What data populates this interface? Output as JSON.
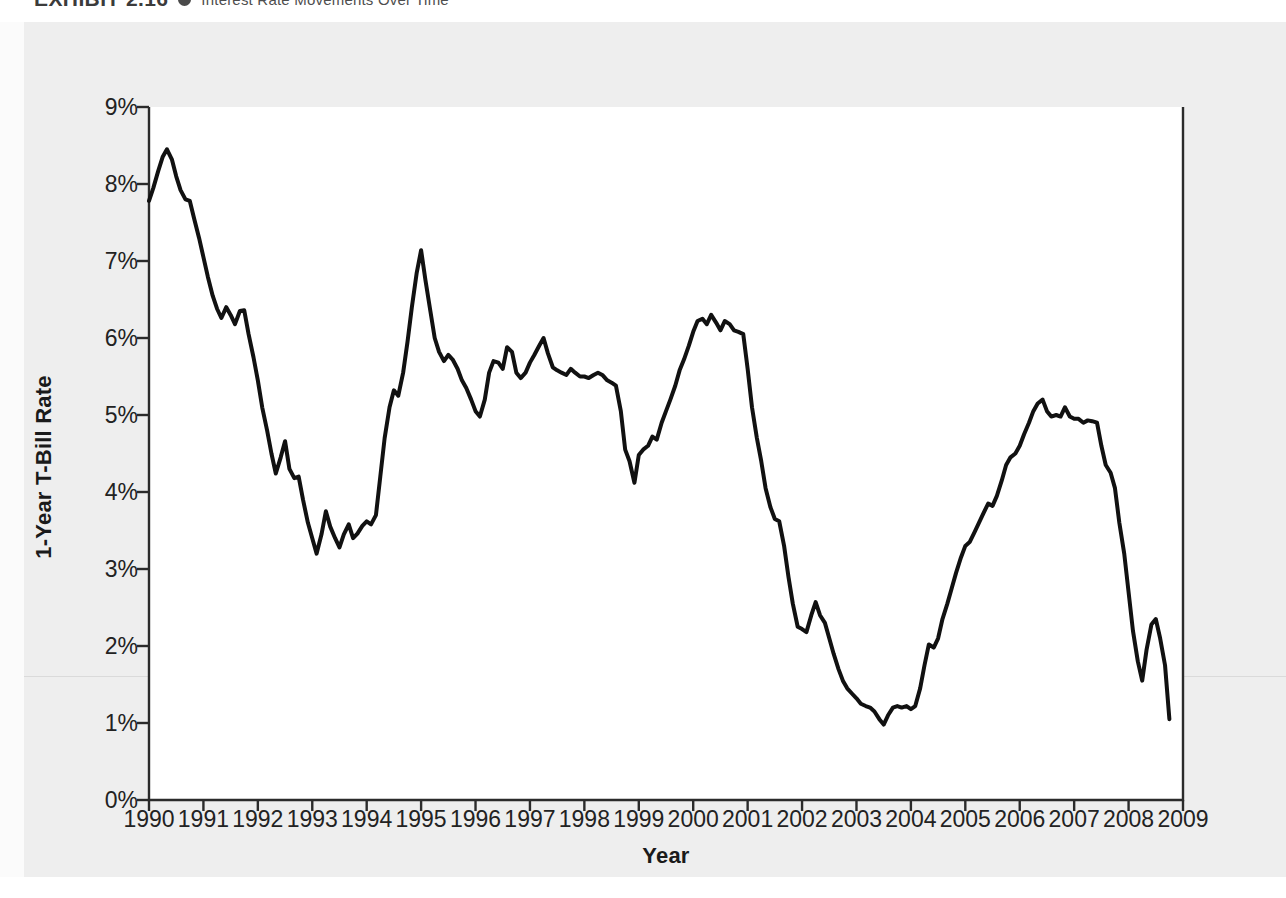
{
  "exhibit": {
    "label": "EXHIBIT 2.16",
    "bullet_icon": "bullet-dot-icon",
    "title": "Interest Rate Movements Over Time"
  },
  "chart_data": {
    "type": "line",
    "title": "Interest Rate Movements Over Time",
    "xlabel": "Year",
    "ylabel": "1-Year T-Bill Rate",
    "xlim": [
      1990,
      2009
    ],
    "ylim": [
      0,
      9
    ],
    "grid": false,
    "legend": null,
    "line_color": "#111111",
    "line_width_px": 4,
    "y_tick_labels": [
      "9%",
      "8%",
      "7%",
      "6%",
      "5%",
      "4%",
      "3%",
      "2%",
      "1%",
      "0%"
    ],
    "y_tick_values": [
      9,
      8,
      7,
      6,
      5,
      4,
      3,
      2,
      1,
      0
    ],
    "x_tick_labels": [
      "1990",
      "1991",
      "1992",
      "1993",
      "1994",
      "1995",
      "1996",
      "1997",
      "1998",
      "1999",
      "2000",
      "2001",
      "2002",
      "2003",
      "2004",
      "2005",
      "2006",
      "2007",
      "2008",
      "2009"
    ],
    "x_tick_values": [
      1990,
      1991,
      1992,
      1993,
      1994,
      1995,
      1996,
      1997,
      1998,
      1999,
      2000,
      2001,
      2002,
      2003,
      2004,
      2005,
      2006,
      2007,
      2008,
      2009
    ],
    "series": [
      {
        "name": "1-Year T-Bill Rate",
        "x": [
          1990.0,
          1990.08,
          1990.17,
          1990.25,
          1990.33,
          1990.42,
          1990.5,
          1990.58,
          1990.67,
          1990.75,
          1990.83,
          1990.92,
          1991.0,
          1991.08,
          1991.17,
          1991.25,
          1991.33,
          1991.42,
          1991.5,
          1991.58,
          1991.67,
          1991.75,
          1991.83,
          1991.92,
          1992.0,
          1992.08,
          1992.17,
          1992.25,
          1992.33,
          1992.42,
          1992.5,
          1992.58,
          1992.67,
          1992.75,
          1992.83,
          1992.92,
          1993.0,
          1993.08,
          1993.17,
          1993.25,
          1993.33,
          1993.42,
          1993.5,
          1993.58,
          1993.67,
          1993.75,
          1993.83,
          1993.92,
          1994.0,
          1994.08,
          1994.17,
          1994.25,
          1994.33,
          1994.42,
          1994.5,
          1994.58,
          1994.67,
          1994.75,
          1994.83,
          1994.92,
          1995.0,
          1995.08,
          1995.17,
          1995.25,
          1995.33,
          1995.42,
          1995.5,
          1995.58,
          1995.67,
          1995.75,
          1995.83,
          1995.92,
          1996.0,
          1996.08,
          1996.17,
          1996.25,
          1996.33,
          1996.42,
          1996.5,
          1996.58,
          1996.67,
          1996.75,
          1996.83,
          1996.92,
          1997.0,
          1997.08,
          1997.17,
          1997.25,
          1997.33,
          1997.42,
          1997.5,
          1997.58,
          1997.67,
          1997.75,
          1997.83,
          1997.92,
          1998.0,
          1998.08,
          1998.17,
          1998.25,
          1998.33,
          1998.42,
          1998.5,
          1998.58,
          1998.67,
          1998.75,
          1998.83,
          1998.92,
          1999.0,
          1999.08,
          1999.17,
          1999.25,
          1999.33,
          1999.42,
          1999.5,
          1999.58,
          1999.67,
          1999.75,
          1999.83,
          1999.92,
          2000.0,
          2000.08,
          2000.17,
          2000.25,
          2000.33,
          2000.42,
          2000.5,
          2000.58,
          2000.67,
          2000.75,
          2000.83,
          2000.92,
          2001.0,
          2001.08,
          2001.17,
          2001.25,
          2001.33,
          2001.42,
          2001.5,
          2001.58,
          2001.67,
          2001.75,
          2001.83,
          2001.92,
          2002.0,
          2002.08,
          2002.17,
          2002.25,
          2002.33,
          2002.42,
          2002.5,
          2002.58,
          2002.67,
          2002.75,
          2002.83,
          2002.92,
          2003.0,
          2003.08,
          2003.17,
          2003.25,
          2003.33,
          2003.42,
          2003.5,
          2003.58,
          2003.67,
          2003.75,
          2003.83,
          2003.92,
          2004.0,
          2004.08,
          2004.17,
          2004.25,
          2004.33,
          2004.42,
          2004.5,
          2004.58,
          2004.67,
          2004.75,
          2004.83,
          2004.92,
          2005.0,
          2005.08,
          2005.17,
          2005.25,
          2005.33,
          2005.42,
          2005.5,
          2005.58,
          2005.67,
          2005.75,
          2005.83,
          2005.92,
          2006.0,
          2006.08,
          2006.17,
          2006.25,
          2006.33,
          2006.42,
          2006.5,
          2006.58,
          2006.67,
          2006.75,
          2006.83,
          2006.92,
          2007.0,
          2007.08,
          2007.17,
          2007.25,
          2007.33,
          2007.42,
          2007.5,
          2007.58,
          2007.67,
          2007.75,
          2007.83,
          2007.92,
          2008.0,
          2008.08,
          2008.17,
          2008.25,
          2008.33,
          2008.42,
          2008.5,
          2008.58,
          2008.67,
          2008.75
        ],
        "values": [
          7.78,
          7.95,
          8.17,
          8.35,
          8.45,
          8.32,
          8.1,
          7.92,
          7.8,
          7.78,
          7.55,
          7.3,
          7.05,
          6.8,
          6.55,
          6.38,
          6.26,
          6.4,
          6.3,
          6.18,
          6.35,
          6.36,
          6.05,
          5.75,
          5.45,
          5.1,
          4.8,
          4.5,
          4.24,
          4.45,
          4.66,
          4.3,
          4.18,
          4.2,
          3.9,
          3.6,
          3.4,
          3.2,
          3.45,
          3.75,
          3.55,
          3.4,
          3.28,
          3.45,
          3.58,
          3.4,
          3.46,
          3.56,
          3.62,
          3.58,
          3.7,
          4.2,
          4.7,
          5.1,
          5.32,
          5.25,
          5.55,
          5.95,
          6.4,
          6.85,
          7.14,
          6.75,
          6.35,
          6.0,
          5.82,
          5.7,
          5.78,
          5.72,
          5.6,
          5.45,
          5.35,
          5.2,
          5.05,
          4.98,
          5.2,
          5.55,
          5.7,
          5.68,
          5.6,
          5.88,
          5.82,
          5.55,
          5.48,
          5.55,
          5.68,
          5.78,
          5.9,
          6.0,
          5.8,
          5.62,
          5.58,
          5.55,
          5.52,
          5.6,
          5.55,
          5.5,
          5.5,
          5.48,
          5.52,
          5.55,
          5.52,
          5.45,
          5.42,
          5.38,
          5.05,
          4.55,
          4.4,
          4.12,
          4.48,
          4.55,
          4.6,
          4.72,
          4.68,
          4.9,
          5.05,
          5.2,
          5.38,
          5.58,
          5.72,
          5.9,
          6.08,
          6.22,
          6.25,
          6.18,
          6.3,
          6.2,
          6.1,
          6.22,
          6.18,
          6.1,
          6.08,
          6.05,
          5.6,
          5.1,
          4.7,
          4.4,
          4.05,
          3.8,
          3.65,
          3.62,
          3.3,
          2.9,
          2.55,
          2.25,
          2.22,
          2.18,
          2.4,
          2.57,
          2.4,
          2.3,
          2.1,
          1.9,
          1.7,
          1.55,
          1.45,
          1.38,
          1.32,
          1.25,
          1.22,
          1.2,
          1.15,
          1.05,
          0.98,
          1.1,
          1.2,
          1.22,
          1.2,
          1.22,
          1.18,
          1.22,
          1.45,
          1.75,
          2.02,
          1.98,
          2.1,
          2.35,
          2.55,
          2.75,
          2.95,
          3.15,
          3.3,
          3.35,
          3.48,
          3.6,
          3.72,
          3.85,
          3.82,
          3.95,
          4.15,
          4.35,
          4.45,
          4.5,
          4.6,
          4.75,
          4.9,
          5.05,
          5.15,
          5.2,
          5.05,
          4.98,
          5.0,
          4.98,
          5.1,
          4.98,
          4.95,
          4.95,
          4.9,
          4.93,
          4.92,
          4.9,
          4.6,
          4.35,
          4.25,
          4.05,
          3.6,
          3.2,
          2.7,
          2.2,
          1.8,
          1.55,
          1.95,
          2.28,
          2.35,
          2.1,
          1.75,
          1.05
        ]
      }
    ]
  }
}
